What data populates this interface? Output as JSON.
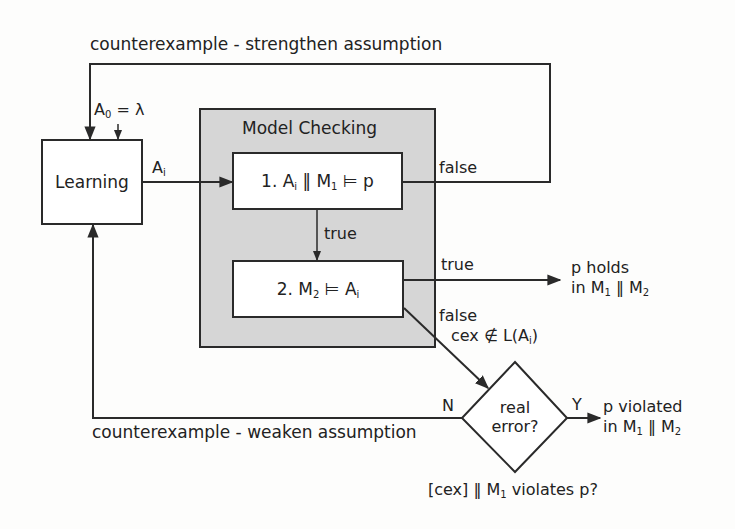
{
  "diagram": {
    "title_top_loop": "counterexample - strengthen assumption",
    "title_bottom_loop": "counterexample - weaken assumption",
    "initial_assumption": {
      "symbol": "A",
      "sub": "0",
      "rest": " = λ"
    },
    "learning": {
      "label": "Learning"
    },
    "assumption_edge": {
      "symbol": "A",
      "sub": "i"
    },
    "model_checking": {
      "title": "Model Checking",
      "step1": {
        "prefix": "1. A",
        "sub_a": "i",
        "mid": " ‖ M",
        "sub_m": "1",
        "rest": " ⊨ p"
      },
      "step2": {
        "prefix": "2. M",
        "sub_m": "2",
        "mid": " ⊨ A",
        "sub_a": "i"
      },
      "edge_true_internal": "true"
    },
    "edges": {
      "step1_false": "false",
      "step2_true": "true",
      "step2_false": "false",
      "cex_condition": {
        "prefix": "cex ∉ L(A",
        "sub": "i",
        "rest": ")"
      },
      "decision_no": "N",
      "decision_yes": "Y"
    },
    "decision": {
      "line1": "real",
      "line2": "error?",
      "caption": {
        "prefix": "[cex] ‖ M",
        "sub": "1",
        "rest": " violates p?"
      }
    },
    "outcomes": {
      "holds": {
        "line1": "p holds",
        "line2_prefix": "in M",
        "sub1": "1",
        "mid": " ‖ M",
        "sub2": "2"
      },
      "violated": {
        "line1": "p violated",
        "line2_prefix": "in M",
        "sub1": "1",
        "mid": " ‖ M",
        "sub2": "2"
      }
    },
    "colors": {
      "stroke": "#2a2a2a",
      "gray_fill": "#d6d6d6",
      "background": "#fdfdfc"
    }
  }
}
